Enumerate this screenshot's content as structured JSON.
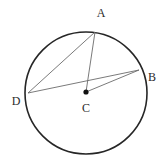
{
  "figure": {
    "type": "geometry-diagram",
    "width": 163,
    "height": 165,
    "background_color": "#ffffff",
    "circle": {
      "center_x": 86,
      "center_y": 93,
      "radius": 61,
      "stroke_color": "#262626",
      "stroke_width": 1.6,
      "fill": "none"
    },
    "center_dot": {
      "x": 86,
      "y": 92,
      "radius": 2.6,
      "color": "#101010"
    },
    "points": [
      {
        "id": "A",
        "label": "A",
        "x": 95,
        "y": 32,
        "label_x": 101,
        "label_y": 13,
        "on_circle": true
      },
      {
        "id": "B",
        "label": "B",
        "x": 139,
        "y": 70,
        "label_x": 152,
        "label_y": 77,
        "on_circle": true
      },
      {
        "id": "D",
        "label": "D",
        "x": 28,
        "y": 93,
        "label_x": 16,
        "label_y": 101,
        "on_circle": true
      },
      {
        "id": "C",
        "label": "C",
        "x": 86,
        "y": 92,
        "label_x": 86,
        "label_y": 108,
        "on_circle": false
      }
    ],
    "segments": [
      {
        "id": "AD",
        "from": "A",
        "to": "D",
        "x1": 95,
        "y1": 32,
        "x2": 28,
        "y2": 93,
        "stroke_color": "#6b6b6b",
        "stroke_width": 0.9
      },
      {
        "id": "AC",
        "from": "A",
        "to": "C",
        "x1": 95,
        "y1": 32,
        "x2": 86,
        "y2": 92,
        "stroke_color": "#6b6b6b",
        "stroke_width": 0.9
      },
      {
        "id": "DB",
        "from": "D",
        "to": "B",
        "x1": 28,
        "y1": 93,
        "x2": 139,
        "y2": 70,
        "stroke_color": "#6b6b6b",
        "stroke_width": 0.9
      },
      {
        "id": "CB",
        "from": "C",
        "to": "B",
        "x1": 86,
        "y1": 92,
        "x2": 139,
        "y2": 70,
        "stroke_color": "#6b6b6b",
        "stroke_width": 0.9
      }
    ]
  }
}
